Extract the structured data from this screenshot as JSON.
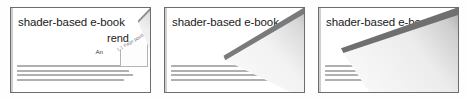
{
  "figure": {
    "caption": "",
    "panel_count": 3,
    "colors": {
      "page": "#ffffff",
      "frame": "#6d6d6d",
      "fold_edge": "#7a7a7a",
      "shadow": "#b9b9b9",
      "body_text": "#9a9a9a"
    }
  },
  "page_content": {
    "title": "shader-based e-book",
    "subtitle": "rend",
    "author": "An",
    "body_lines": [
      "becoming increasingly popular b",
      "mobile GPUs can be combined tog",
      "tion and page flipping functionality",
      "in a vertex shader-based implementa"
    ],
    "next_page_label": "1.1 Page positi"
  },
  "panels": [
    {
      "id": "panel-1",
      "name": "page-flip-frame-1",
      "flip_progress": "0%",
      "state": "page flat, corner beginning to lift"
    },
    {
      "id": "panel-2",
      "name": "page-flip-frame-2",
      "flip_progress": "50%",
      "state": "page folded halfway across"
    },
    {
      "id": "panel-3",
      "name": "page-flip-frame-3",
      "flip_progress": "100%",
      "state": "page folded fully, next page revealed"
    }
  ]
}
